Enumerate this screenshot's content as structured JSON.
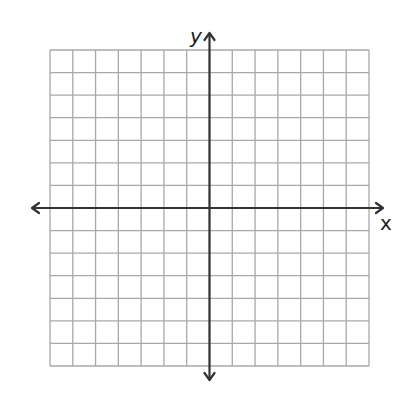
{
  "diagram": {
    "type": "coordinate-plane",
    "grid": {
      "columns": 14,
      "rows": 14,
      "left": 50,
      "top": 50,
      "right": 369,
      "bottom": 366,
      "line_color": "#a8a8a8"
    },
    "axes": {
      "color": "#333333",
      "origin_col": 7,
      "origin_row": 7,
      "x_label": "x",
      "y_label": "y"
    }
  },
  "chart_data": {
    "type": "scatter",
    "title": "",
    "xlabel": "x",
    "ylabel": "y",
    "xlim": [
      -7,
      7
    ],
    "ylim": [
      -7,
      7
    ],
    "grid": true,
    "series": []
  }
}
